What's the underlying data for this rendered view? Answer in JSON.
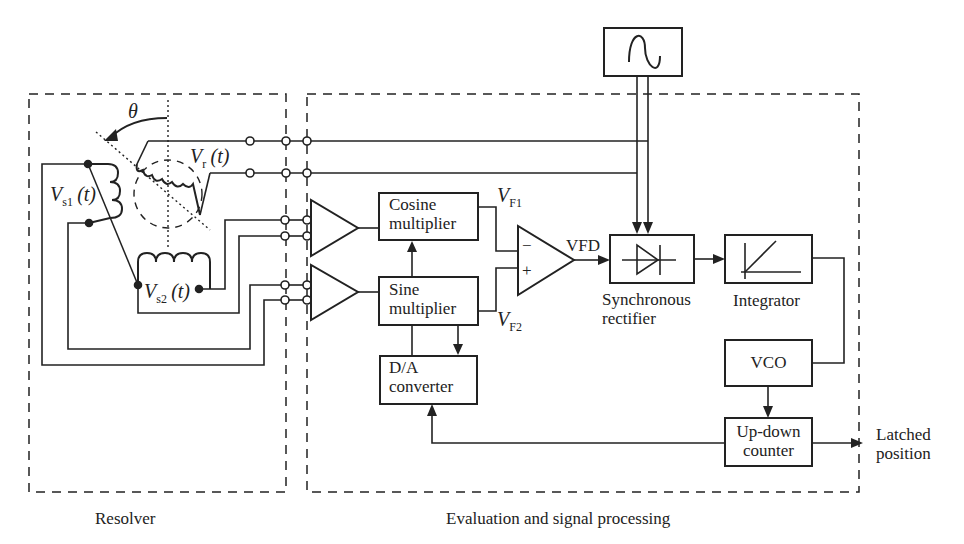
{
  "diagram": {
    "groups": {
      "resolver": {
        "label": "Resolver"
      },
      "evaluation": {
        "label": "Evaluation and signal processing"
      }
    },
    "resolver_labels": {
      "angle": "θ",
      "rotor_voltage": {
        "main": "V",
        "sub": "r",
        "arg": "(t)"
      },
      "stator1_voltage": {
        "main": "V",
        "sub": "s1",
        "arg": "(t)"
      },
      "stator2_voltage": {
        "main": "V",
        "sub": "s2",
        "arg": "(t)"
      }
    },
    "blocks": {
      "cosine_multiplier": {
        "line1": "Cosine",
        "line2": "multiplier"
      },
      "sine_multiplier": {
        "line1": "Sine",
        "line2": "multiplier"
      },
      "da_converter": {
        "line1": "D/A",
        "line2": "converter"
      },
      "sync_rectifier": {
        "line1": "Synchronous",
        "line2": "rectifier"
      },
      "integrator": {
        "label": "Integrator"
      },
      "vco": {
        "label": "VCO"
      },
      "up_down_counter": {
        "line1": "Up-down",
        "line2": "counter"
      },
      "oscillator": {
        "icon": "sine-wave"
      }
    },
    "signals": {
      "vf1": {
        "main": "V",
        "sub": "F1"
      },
      "vf2": {
        "main": "V",
        "sub": "F2"
      },
      "vfd": "VFD",
      "minus": "−",
      "plus": "+",
      "output": {
        "line1": "Latched",
        "line2": "position"
      }
    }
  }
}
